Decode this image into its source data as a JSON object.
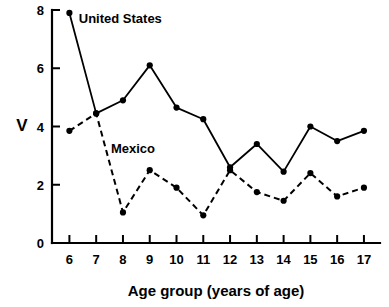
{
  "chart_data": {
    "type": "line",
    "title": "",
    "xlabel": "Age group (years of age)",
    "ylabel": "V",
    "categories": [
      "6",
      "7",
      "8",
      "9",
      "10",
      "11",
      "12",
      "13",
      "14",
      "15",
      "16",
      "17"
    ],
    "x": [
      6,
      7,
      8,
      9,
      10,
      11,
      12,
      13,
      14,
      15,
      16,
      17
    ],
    "xlim": [
      5.35,
      17.6
    ],
    "ylim": [
      0,
      8
    ],
    "xticks": [
      "6",
      "7",
      "8",
      "9",
      "10",
      "11",
      "12",
      "13",
      "14",
      "15",
      "16",
      "17"
    ],
    "yticks": [
      "0",
      "2",
      "4",
      "6",
      "8"
    ],
    "ytick_values": [
      0,
      2,
      4,
      6,
      8
    ],
    "grid": false,
    "legend_position": "inline-annotation",
    "series": [
      {
        "name": "United States",
        "style": "solid",
        "marker": "filled-circle",
        "color": "#000000",
        "values": [
          7.9,
          4.45,
          4.9,
          6.1,
          4.65,
          4.25,
          2.6,
          3.4,
          2.45,
          4.0,
          3.5,
          3.85
        ]
      },
      {
        "name": "Mexico",
        "style": "dashed",
        "marker": "filled-circle",
        "color": "#000000",
        "values": [
          3.85,
          4.45,
          1.05,
          2.5,
          1.9,
          0.95,
          2.5,
          1.75,
          1.45,
          2.4,
          1.6,
          1.9
        ]
      }
    ],
    "annotations": [
      {
        "text": "United States",
        "x": 6.35,
        "y": 7.55
      },
      {
        "text": "Mexico",
        "x": 7.55,
        "y": 3.1
      }
    ]
  },
  "axes": {
    "y_title": "V",
    "x_title": "Age group (years of age)"
  }
}
